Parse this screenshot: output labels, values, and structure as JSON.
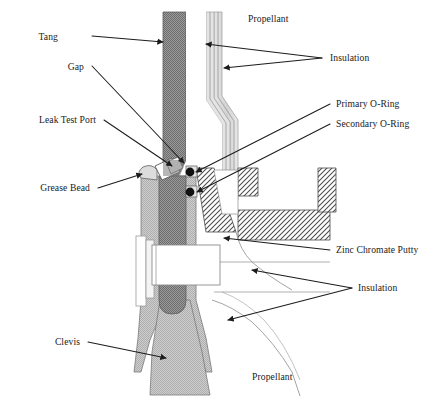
{
  "figure": {
    "background_color": "#ffffff",
    "line_color": "#1c1c1c",
    "text_color": "#1a1a1a"
  },
  "labels": {
    "tang": "Tang",
    "gap": "Gap",
    "leak_test_port": "Leak Test Port",
    "grease_bead": "Grease Bead",
    "clevis": "Clevis",
    "propellant_top": "Propellant",
    "propellant_bottom": "Propellant",
    "insulation_top": "Insulation",
    "insulation_bottom": "Insulation",
    "primary_oring": "Primary O-Ring",
    "secondary_oring": "Secondary O-Ring",
    "zinc_chromate_putty": "Zinc Chromate Putty"
  },
  "materials": {
    "tang_fill": "#8a8a8a",
    "clevis_fill": "#cccccc",
    "slot_fill": "#8f8f8f",
    "insulation_fill": "#d8d8d8",
    "putty_fill": "#e8e8e8",
    "oring_fill": "#111111",
    "hatch_stroke": "#4f4f4f",
    "white_fill": "#ffffff"
  },
  "components": [
    {
      "name": "tang",
      "label": "Tang",
      "shading": "dark-gray-dither"
    },
    {
      "name": "clevis",
      "label": "Clevis",
      "shading": "light-gray-dither"
    },
    {
      "name": "primary-o-ring",
      "label": "Primary O-Ring",
      "shading": "solid-black"
    },
    {
      "name": "secondary-o-ring",
      "label": "Secondary O-Ring",
      "shading": "solid-black"
    },
    {
      "name": "zinc-chromate-putty",
      "label": "Zinc Chromate Putty",
      "shading": "diagonal-hatch"
    },
    {
      "name": "insulation",
      "label": "Insulation",
      "shading": "light-gray"
    },
    {
      "name": "propellant",
      "label": "Propellant",
      "shading": "white"
    },
    {
      "name": "grease-bead",
      "label": "Grease Bead",
      "shading": "light-gray"
    },
    {
      "name": "leak-test-port",
      "label": "Leak Test Port",
      "shading": "white"
    },
    {
      "name": "gap",
      "label": "Gap",
      "shading": "none"
    }
  ]
}
